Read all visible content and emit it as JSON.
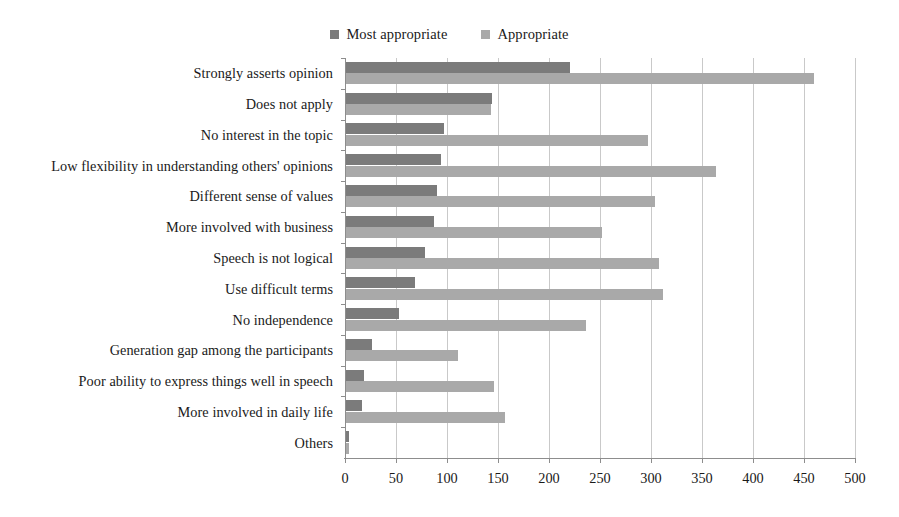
{
  "chart_data": {
    "type": "bar",
    "orientation": "horizontal",
    "title": "",
    "xlabel": "",
    "ylabel": "",
    "xlim": [
      0,
      500
    ],
    "xticks": [
      0,
      50,
      100,
      150,
      200,
      250,
      300,
      350,
      400,
      450,
      500
    ],
    "grid": "vertical",
    "legend_position": "top-center",
    "categories": [
      "Strongly asserts opinion",
      "Does not apply",
      "No interest in the topic",
      "Low flexibility in understanding others' opinions",
      "Different sense of values",
      "More involved with business",
      "Speech is not logical",
      "Use difficult terms",
      "No independence",
      "Generation gap among the participants",
      "Poor ability to express things well in speech",
      "More involved in daily life",
      "Others"
    ],
    "series": [
      {
        "name": "Most appropriate",
        "color": "#7b7b7b",
        "values": [
          220,
          143,
          96,
          93,
          89,
          86,
          77,
          68,
          52,
          25,
          18,
          16,
          3
        ]
      },
      {
        "name": "Appropriate",
        "color": "#a9a9a9",
        "values": [
          459,
          142,
          296,
          363,
          303,
          251,
          307,
          311,
          235,
          110,
          145,
          156,
          3
        ]
      }
    ]
  },
  "legend": {
    "entries": [
      {
        "label": "Most appropriate",
        "color": "#7b7b7b"
      },
      {
        "label": "Appropriate",
        "color": "#a9a9a9"
      }
    ]
  }
}
